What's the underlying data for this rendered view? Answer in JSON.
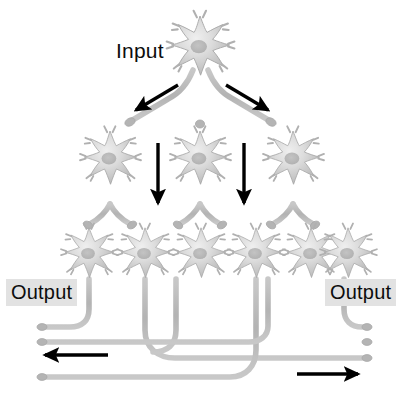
{
  "figure": {
    "background_color": "#ffffff",
    "neuron_fill": "#c9c9c9",
    "neuron_stroke": "#a8a8a8",
    "axon_color": "#b4b4b4",
    "arrow_color": "#000000",
    "label_text_color": "#0d0d0d",
    "label_highlight_color": "#e2e2e2"
  },
  "labels": {
    "input": "Input",
    "output_left": "Output",
    "output_right": "Output"
  },
  "layers": {
    "input_layer": {
      "name": "input-neuron-layer",
      "count": 1,
      "neurons": [
        {
          "id": "n-in-1",
          "cx": 200,
          "cy": 46,
          "r": 30
        }
      ]
    },
    "middle_layer": {
      "name": "middle-neuron-layer",
      "count": 3,
      "neurons": [
        {
          "id": "n-mid-1",
          "cx": 110,
          "cy": 158,
          "r": 27
        },
        {
          "id": "n-mid-2",
          "cx": 200,
          "cy": 158,
          "r": 27
        },
        {
          "id": "n-mid-3",
          "cx": 293,
          "cy": 158,
          "r": 27
        }
      ]
    },
    "output_layer": {
      "name": "output-neuron-layer",
      "count": 6,
      "neurons": [
        {
          "id": "n-out-1",
          "cx": 89,
          "cy": 253,
          "r": 26
        },
        {
          "id": "n-out-2",
          "cx": 145,
          "cy": 253,
          "r": 26
        },
        {
          "id": "n-out-3",
          "cx": 201,
          "cy": 253,
          "r": 26
        },
        {
          "id": "n-out-4",
          "cx": 256,
          "cy": 253,
          "r": 26
        },
        {
          "id": "n-out-5",
          "cx": 311,
          "cy": 253,
          "r": 26
        },
        {
          "id": "n-out-6",
          "cx": 344,
          "cy": 253,
          "r": 26
        }
      ]
    }
  },
  "arrows": {
    "count": 6,
    "items": [
      {
        "id": "arrow-diverge-left",
        "direction": "down-left",
        "x1": 176,
        "y1": 86,
        "x2": 134,
        "y2": 111
      },
      {
        "id": "arrow-diverge-right",
        "direction": "down-right",
        "x1": 227,
        "y1": 86,
        "x2": 269,
        "y2": 111
      },
      {
        "id": "arrow-vertical-left",
        "direction": "down",
        "x1": 158,
        "y1": 146,
        "x2": 158,
        "y2": 205
      },
      {
        "id": "arrow-vertical-right",
        "direction": "down",
        "x1": 244,
        "y1": 146,
        "x2": 244,
        "y2": 205
      },
      {
        "id": "arrow-output-left",
        "direction": "left",
        "x1": 107,
        "y1": 355,
        "x2": 42,
        "y2": 355
      },
      {
        "id": "arrow-output-right",
        "direction": "right",
        "x1": 296,
        "y1": 374,
        "x2": 360,
        "y2": 374
      }
    ]
  },
  "output_axons": {
    "count": 4,
    "description": "Long horizontal axon fibers leaving the output layer",
    "fibers": [
      {
        "id": "axon-fiber-1",
        "y": 327,
        "from_x": 40,
        "to_x": 90,
        "terminal": "left",
        "source_neuron": "n-out-1"
      },
      {
        "id": "axon-fiber-2",
        "y": 342,
        "from_x": 40,
        "to_x": 368,
        "terminal": "both",
        "source_neuron": "n-out-5"
      },
      {
        "id": "axon-fiber-3",
        "y": 358,
        "from_x": 150,
        "to_x": 368,
        "terminal": "right",
        "source_neuron": "n-out-2"
      },
      {
        "id": "axon-fiber-4",
        "y": 377,
        "from_x": 40,
        "to_x": 260,
        "terminal": "left",
        "source_neuron": "n-out-4"
      }
    ]
  }
}
